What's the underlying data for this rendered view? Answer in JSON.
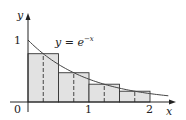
{
  "chart_data": {
    "type": "bar",
    "title": "",
    "function_label": "y = e^{-x}",
    "function_label_parts": {
      "base": "y = e",
      "exponent": "−x"
    },
    "xlabel": "x",
    "ylabel": "y",
    "x_ticks": [
      "0",
      "1",
      "2"
    ],
    "y_ticks": [
      "1"
    ],
    "xlim": [
      0,
      2.3
    ],
    "ylim": [
      0,
      1.25
    ],
    "grid": false,
    "method": "midpoint rule, n = 4",
    "categories": [
      "[0, 0.5]",
      "[0.5, 1]",
      "[1, 1.5]",
      "[1.5, 2]"
    ],
    "midpoints": [
      0.25,
      0.75,
      1.25,
      1.75
    ],
    "values": [
      0.779,
      0.472,
      0.287,
      0.174
    ],
    "curve": {
      "function": "e^(-x)",
      "x_range": [
        0,
        2.3
      ]
    },
    "colors": {
      "bar_fill": "#e2e2e2",
      "bar_stroke": "#333333",
      "curve": "#444444",
      "axis": "#222222"
    }
  }
}
